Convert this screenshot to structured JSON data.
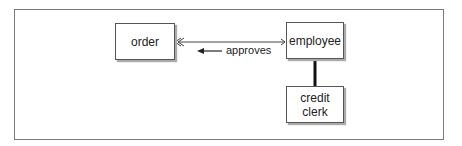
{
  "diagram": {
    "entities": [
      {
        "id": "order",
        "label": "order"
      },
      {
        "id": "employee",
        "label": "employee"
      },
      {
        "id": "credit_clerk",
        "label": "credit\nclerk",
        "line1": "credit",
        "line2": "clerk"
      }
    ],
    "relationships": [
      {
        "from": "employee",
        "to": "order",
        "label": "approves",
        "direction": "employee approves order",
        "crowfoot_at": "order"
      },
      {
        "from": "employee",
        "to": "credit_clerk",
        "type": "subtype",
        "style": "thick line"
      }
    ],
    "relationship_label": "approves"
  }
}
